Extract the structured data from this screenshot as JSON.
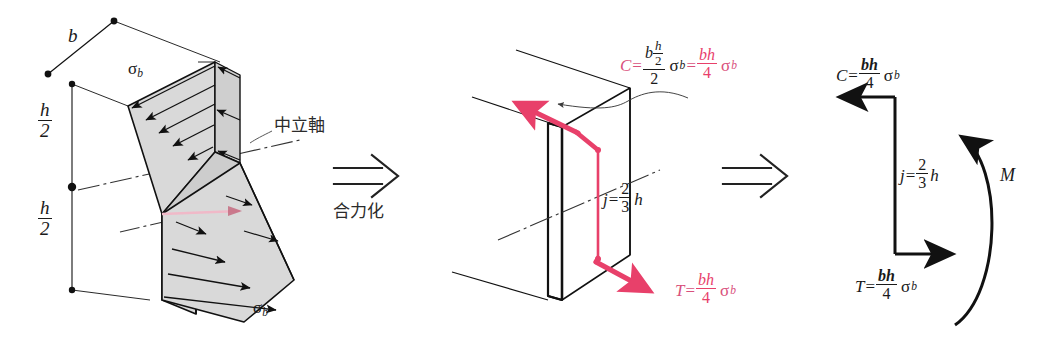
{
  "figure": {
    "type": "engineering-diagram",
    "colors": {
      "pink": "#e8406a",
      "pink_text": "#d9517c",
      "ink": "#1a1a1a",
      "shade": "#d7d7d7",
      "background": "#ffffff"
    }
  },
  "panel_left": {
    "name": "stress-distribution-block",
    "dim_b": "b",
    "dim_h_upper_num": "h",
    "dim_h_upper_den": "2",
    "dim_h_lower_num": "h",
    "dim_h_lower_den": "2",
    "sigma_top": "σ",
    "sigma_top_sub": "b",
    "sigma_bottom": "σ",
    "sigma_bottom_sub": "b",
    "neutral_axis_label": "中立軸"
  },
  "arrow_1": {
    "name": "resultant-arrow",
    "caption": "合力化"
  },
  "panel_middle": {
    "name": "force-couple-block",
    "C_symbol": "C",
    "C_equals": "=",
    "C_numer_b": "b",
    "C_numer_frac_num": "h",
    "C_numer_frac_den": "2",
    "C_denom": "2",
    "C_sigma": "σ",
    "C_sigma_sub": "b",
    "C_equals2": "=",
    "C_result_num": "bh",
    "C_result_den": "4",
    "C_result_sigma": "σ",
    "C_result_sigma_sub": "b",
    "j_symbol": "j",
    "j_equals": "=",
    "j_num": "2",
    "j_den": "3",
    "j_h": "h",
    "T_symbol": "T",
    "T_equals": "=",
    "T_num": "bh",
    "T_den": "4",
    "T_sigma": "σ",
    "T_sigma_sub": "b"
  },
  "arrow_2": {
    "name": "second-resultant-arrow",
    "caption": ""
  },
  "panel_right": {
    "name": "moment-couple-diagram",
    "C_symbol": "C",
    "C_equals": "=",
    "C_num": "bh",
    "C_den": "4",
    "C_sigma": "σ",
    "C_sigma_sub": "b",
    "j_symbol": "j",
    "j_equals": "=",
    "j_num": "2",
    "j_den": "3",
    "j_h": "h",
    "M_symbol": "M",
    "T_symbol": "T",
    "T_equals": "=",
    "T_num": "bh",
    "T_den": "4",
    "T_sigma": "σ",
    "T_sigma_sub": "b"
  }
}
